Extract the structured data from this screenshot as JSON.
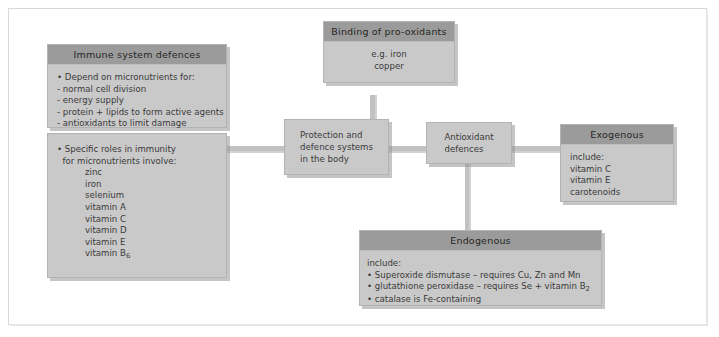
{
  "diagram": {
    "title_hidden": "Protection and defence systems in the body",
    "boxes": {
      "immune": {
        "header": "Immune system defences",
        "lines": [
          "• Depend on micronutrients for:",
          "- normal cell division",
          "- energy supply",
          "- protein + lipids to form active agents",
          "- antioxidants to limit damage"
        ]
      },
      "specific_roles": {
        "lines": [
          "• Specific roles in immunity",
          "  for micronutrients involve:"
        ],
        "items": [
          "zinc",
          "iron",
          "selenium",
          "vitamin A",
          "vitamin C",
          "vitamin D",
          "vitamin E",
          "vitamin B6"
        ],
        "last_item_base": "vitamin B",
        "last_item_sub": "6"
      },
      "binding": {
        "header": "Binding of pro-oxidants",
        "lines": [
          "e.g. iron",
          "copper"
        ]
      },
      "protection": {
        "lines": [
          "Protection and",
          "defence systems",
          "in the body"
        ]
      },
      "antioxidant": {
        "lines": [
          "Antioxidant",
          "defences"
        ]
      },
      "exogenous": {
        "header": "Exogenous",
        "lines": [
          "include:",
          "vitamin C",
          "vitamin E",
          "carotenoids"
        ]
      },
      "endogenous": {
        "header": "Endogenous",
        "intro": "include:",
        "bullets": [
          {
            "base": "• Superoxide dismutase – requires Cu, Zn and Mn",
            "sub": "",
            "tail": ""
          },
          {
            "base": "• glutathione peroxidase – requires Se + vitamin B",
            "sub": "2",
            "tail": ""
          },
          {
            "base": "• catalase is Fe-containing",
            "sub": "",
            "tail": ""
          }
        ]
      }
    },
    "colors": {
      "box_body": "#c9c9c9",
      "box_header": "#9b9b9b",
      "connector": "#c2c2c2",
      "frame": "#d9d9d9",
      "background": "#ffffff",
      "text": "#3a3a3a"
    }
  }
}
